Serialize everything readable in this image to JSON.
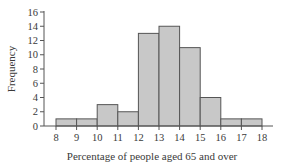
{
  "chart_data": {
    "type": "bar",
    "subtype": "histogram",
    "title": "",
    "xlabel": "Percentage of people aged 65 and over",
    "ylabel": "Frequency",
    "bin_edges": [
      8,
      9,
      10,
      11,
      12,
      13,
      14,
      15,
      16,
      17,
      18
    ],
    "categories": [
      "8-9",
      "9-10",
      "10-11",
      "11-12",
      "12-13",
      "13-14",
      "14-15",
      "15-16",
      "16-17",
      "17-18"
    ],
    "values": [
      1,
      1,
      3,
      2,
      13,
      14,
      11,
      4,
      1,
      1
    ],
    "xticks": [
      8,
      9,
      10,
      11,
      12,
      13,
      14,
      15,
      16,
      17,
      18
    ],
    "yticks": [
      0,
      2,
      4,
      6,
      8,
      10,
      12,
      14,
      16
    ],
    "xlim": [
      8,
      18
    ],
    "ylim": [
      0,
      16
    ],
    "grid": false,
    "legend": null,
    "colors": {
      "bar_fill": "#c8c8c8",
      "bar_edge": "#555555",
      "axis": "#555555"
    }
  }
}
